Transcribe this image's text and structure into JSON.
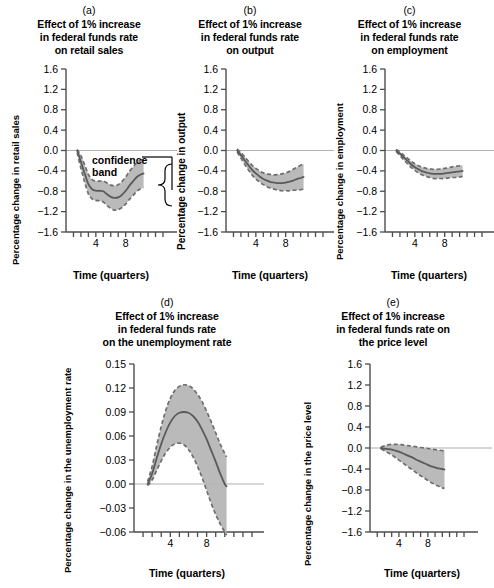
{
  "figure": {
    "background": "#ffffff",
    "band_fill": "#b4b4b4",
    "band_edge": "#6e6e6e",
    "center_line": "#5a5a5a",
    "axis_color": "#4d4d4d",
    "zero_line": "#b0b0b0",
    "x_axis_label": "Time (quarters)"
  },
  "annotation": {
    "confidence_line1": "confidence",
    "confidence_line2": "band"
  },
  "chart_data": [
    {
      "id": "panel-a",
      "type": "line",
      "letter": "(a)",
      "title_lines": [
        "Effect of 1% increase",
        "in federal funds rate",
        "on retail sales"
      ],
      "title": "Effect of 1% increase in federal funds rate on retail sales",
      "xlabel": "Time (quarters)",
      "ylabel": "Percentage change in retail sales",
      "xlim": [
        0,
        13
      ],
      "ylim": [
        -1.6,
        1.6
      ],
      "xticks": [
        1,
        2,
        3,
        4,
        5,
        6,
        7,
        8,
        9,
        10,
        11,
        12,
        13
      ],
      "xticklabels": {
        "4": "4",
        "8": "8"
      },
      "yticks": [
        1.6,
        1.2,
        0.8,
        0.4,
        0.0,
        -0.4,
        -0.8,
        -1.2,
        -1.6
      ],
      "yticklabels": [
        "1.6",
        "1.2",
        "0.8",
        "0.4",
        "0.0",
        "−0.4",
        "−0.8",
        "−1.2",
        "−1.6"
      ],
      "grid": false,
      "legend": "none",
      "zero_line": 0.0,
      "x": [
        1.5,
        2,
        2.5,
        3,
        3.5,
        4,
        4.5,
        5,
        5.5,
        6,
        6.5,
        7,
        7.5,
        8,
        8.5,
        9,
        9.5,
        10,
        10.4
      ],
      "series": [
        {
          "name": "point estimate",
          "style": "solid",
          "values": [
            0.0,
            -0.22,
            -0.45,
            -0.66,
            -0.76,
            -0.79,
            -0.79,
            -0.8,
            -0.86,
            -0.91,
            -0.93,
            -0.92,
            -0.87,
            -0.79,
            -0.69,
            -0.6,
            -0.52,
            -0.47,
            -0.45
          ]
        },
        {
          "name": "upper confidence band",
          "style": "dashed",
          "values": [
            0.02,
            -0.1,
            -0.28,
            -0.47,
            -0.57,
            -0.6,
            -0.6,
            -0.6,
            -0.64,
            -0.68,
            -0.69,
            -0.67,
            -0.61,
            -0.52,
            -0.41,
            -0.32,
            -0.24,
            -0.19,
            -0.17
          ]
        },
        {
          "name": "lower confidence band",
          "style": "dashed",
          "values": [
            -0.04,
            -0.35,
            -0.62,
            -0.85,
            -0.95,
            -0.98,
            -0.99,
            -1.01,
            -1.08,
            -1.14,
            -1.17,
            -1.16,
            -1.12,
            -1.05,
            -0.96,
            -0.88,
            -0.8,
            -0.75,
            -0.73
          ]
        }
      ]
    },
    {
      "id": "panel-b",
      "type": "line",
      "letter": "(b)",
      "title_lines": [
        "Effect of 1% increase",
        "in federal funds rate",
        "on output"
      ],
      "title": "Effect of 1% increase in federal funds rate on output",
      "xlabel": "Time (quarters)",
      "ylabel": "Percentage change in output",
      "xlim": [
        0,
        13
      ],
      "ylim": [
        -1.6,
        1.6
      ],
      "xticks": [
        1,
        2,
        3,
        4,
        5,
        6,
        7,
        8,
        9,
        10,
        11,
        12,
        13
      ],
      "xticklabels": {
        "4": "4",
        "8": "8"
      },
      "yticks": [
        1.6,
        1.2,
        0.8,
        0.4,
        0.0,
        -0.4,
        -0.8,
        -1.2,
        -1.6
      ],
      "yticklabels": [
        "1.6",
        "1.2",
        "0.8",
        "0.4",
        "0.0",
        "−0.4",
        "−0.8",
        "−1.2",
        "−1.6"
      ],
      "grid": false,
      "legend": "none",
      "zero_line": 0.0,
      "x": [
        1.5,
        2,
        2.5,
        3,
        3.5,
        4,
        4.5,
        5,
        5.5,
        6,
        6.5,
        7,
        7.5,
        8,
        8.5,
        9,
        9.5,
        10,
        10.4
      ],
      "series": [
        {
          "name": "point estimate",
          "style": "solid",
          "values": [
            0.0,
            -0.09,
            -0.19,
            -0.29,
            -0.38,
            -0.45,
            -0.51,
            -0.56,
            -0.59,
            -0.62,
            -0.63,
            -0.64,
            -0.64,
            -0.63,
            -0.61,
            -0.59,
            -0.56,
            -0.54,
            -0.52
          ]
        },
        {
          "name": "upper confidence band",
          "style": "dashed",
          "values": [
            0.03,
            -0.04,
            -0.12,
            -0.21,
            -0.29,
            -0.35,
            -0.4,
            -0.44,
            -0.46,
            -0.47,
            -0.48,
            -0.47,
            -0.46,
            -0.44,
            -0.41,
            -0.37,
            -0.33,
            -0.29,
            -0.26
          ]
        },
        {
          "name": "lower confidence band",
          "style": "dashed",
          "values": [
            -0.03,
            -0.15,
            -0.27,
            -0.38,
            -0.48,
            -0.56,
            -0.62,
            -0.67,
            -0.71,
            -0.74,
            -0.76,
            -0.78,
            -0.79,
            -0.79,
            -0.79,
            -0.78,
            -0.78,
            -0.77,
            -0.76
          ]
        }
      ]
    },
    {
      "id": "panel-c",
      "type": "line",
      "letter": "(c)",
      "title_lines": [
        "Effect of 1% increase",
        "in federal funds rate",
        "on employment"
      ],
      "title": "Effect of 1% increase in federal funds rate on employment",
      "xlabel": "Time (quarters)",
      "ylabel": "Percentage change in employment",
      "xlim": [
        0,
        13
      ],
      "ylim": [
        -1.6,
        1.6
      ],
      "xticks": [
        1,
        2,
        3,
        4,
        5,
        6,
        7,
        8,
        9,
        10,
        11,
        12,
        13
      ],
      "xticklabels": {
        "4": "4",
        "8": "8"
      },
      "yticks": [
        1.6,
        1.2,
        0.8,
        0.4,
        0.0,
        -0.4,
        -0.8,
        -1.2,
        -1.6
      ],
      "yticklabels": [
        "1.6",
        "1.2",
        "0.8",
        "0.4",
        "0.0",
        "−0.4",
        "−0.8",
        "−1.2",
        "−1.6"
      ],
      "grid": false,
      "legend": "none",
      "zero_line": 0.0,
      "x": [
        1.5,
        2,
        2.5,
        3,
        3.5,
        4,
        4.5,
        5,
        5.5,
        6,
        6.5,
        7,
        7.5,
        8,
        8.5,
        9,
        9.5,
        10,
        10.4
      ],
      "series": [
        {
          "name": "point estimate",
          "style": "solid",
          "values": [
            0.0,
            -0.06,
            -0.13,
            -0.2,
            -0.27,
            -0.33,
            -0.37,
            -0.41,
            -0.43,
            -0.45,
            -0.46,
            -0.46,
            -0.46,
            -0.45,
            -0.44,
            -0.43,
            -0.42,
            -0.41,
            -0.4
          ]
        },
        {
          "name": "upper confidence band",
          "style": "dashed",
          "values": [
            0.02,
            -0.03,
            -0.09,
            -0.15,
            -0.21,
            -0.26,
            -0.3,
            -0.33,
            -0.35,
            -0.36,
            -0.37,
            -0.37,
            -0.36,
            -0.35,
            -0.34,
            -0.32,
            -0.31,
            -0.3,
            -0.29
          ]
        },
        {
          "name": "lower confidence band",
          "style": "dashed",
          "values": [
            -0.02,
            -0.1,
            -0.18,
            -0.26,
            -0.33,
            -0.39,
            -0.44,
            -0.48,
            -0.51,
            -0.53,
            -0.55,
            -0.55,
            -0.55,
            -0.55,
            -0.54,
            -0.53,
            -0.53,
            -0.52,
            -0.51
          ]
        }
      ]
    },
    {
      "id": "panel-d",
      "type": "line",
      "letter": "(d)",
      "title_lines": [
        "Effect of 1% increase",
        "in federal funds rate",
        "on the unemployment rate"
      ],
      "title": "Effect of 1% increase in federal funds rate on the unemployment rate",
      "xlabel": "Time (quarters)",
      "ylabel": "Percentage change in the unemployment rate",
      "xlim": [
        0,
        13
      ],
      "ylim": [
        -0.06,
        0.15
      ],
      "xticks": [
        1,
        2,
        3,
        4,
        5,
        6,
        7,
        8,
        9,
        10,
        11,
        12,
        13
      ],
      "xticklabels": {
        "4": "4",
        "8": "8"
      },
      "yticks": [
        0.15,
        0.12,
        0.09,
        0.06,
        0.03,
        0.0,
        -0.03,
        -0.06
      ],
      "yticklabels": [
        "0.15",
        "0.12",
        "0.09",
        "0.06",
        "0.03",
        "0.00",
        "−0.03",
        "−0.06"
      ],
      "grid": false,
      "legend": "none",
      "zero_line": 0.0,
      "x": [
        1.5,
        2,
        2.5,
        3,
        3.5,
        4,
        4.5,
        5,
        5.5,
        6,
        6.5,
        7,
        7.5,
        8,
        8.5,
        9,
        9.5,
        10,
        10.2
      ],
      "series": [
        {
          "name": "point estimate",
          "style": "solid",
          "values": [
            0.0,
            0.013,
            0.032,
            0.05,
            0.065,
            0.077,
            0.085,
            0.089,
            0.09,
            0.089,
            0.085,
            0.078,
            0.068,
            0.056,
            0.042,
            0.028,
            0.013,
            0.0,
            -0.003
          ]
        },
        {
          "name": "upper confidence band",
          "style": "dashed",
          "values": [
            0.003,
            0.022,
            0.048,
            0.072,
            0.092,
            0.107,
            0.117,
            0.122,
            0.124,
            0.123,
            0.119,
            0.112,
            0.103,
            0.091,
            0.078,
            0.064,
            0.05,
            0.038,
            0.034
          ]
        },
        {
          "name": "lower confidence band",
          "style": "dashed",
          "values": [
            -0.002,
            0.005,
            0.017,
            0.029,
            0.039,
            0.046,
            0.05,
            0.051,
            0.049,
            0.043,
            0.034,
            0.022,
            0.008,
            -0.008,
            -0.024,
            -0.038,
            -0.05,
            -0.06,
            -0.064
          ]
        }
      ]
    },
    {
      "id": "panel-e",
      "type": "line",
      "letter": "(e)",
      "title_lines": [
        "Effect of 1% increase",
        "in federal funds rate on",
        "the price level"
      ],
      "title": "Effect of 1% increase in federal funds rate on the price level",
      "xlabel": "Time (quarters)",
      "ylabel": "Percentage change in the price level",
      "xlim": [
        0,
        13
      ],
      "ylim": [
        -1.6,
        1.6
      ],
      "xticks": [
        1,
        2,
        3,
        4,
        5,
        6,
        7,
        8,
        9,
        10,
        11,
        12,
        13
      ],
      "xticklabels": {
        "4": "4",
        "8": "8"
      },
      "yticks": [
        1.6,
        1.2,
        0.8,
        0.4,
        0.0,
        -0.4,
        -0.8,
        -1.2,
        -1.6
      ],
      "yticklabels": [
        "1.6",
        "1.2",
        "0.8",
        "0.4",
        "0.0",
        "−0.4",
        "−0.8",
        "−1.2",
        "−1.6"
      ],
      "grid": false,
      "legend": "none",
      "zero_line": 0.0,
      "x": [
        1.5,
        2,
        2.5,
        3,
        3.5,
        4,
        4.5,
        5,
        5.5,
        6,
        6.5,
        7,
        7.5,
        8,
        8.5,
        9,
        9.5,
        10,
        10.3
      ],
      "series": [
        {
          "name": "point estimate",
          "style": "solid",
          "values": [
            0.0,
            -0.01,
            -0.02,
            -0.03,
            -0.05,
            -0.07,
            -0.1,
            -0.13,
            -0.16,
            -0.19,
            -0.23,
            -0.26,
            -0.29,
            -0.32,
            -0.35,
            -0.37,
            -0.39,
            -0.4,
            -0.41
          ]
        },
        {
          "name": "upper confidence band",
          "style": "dashed",
          "values": [
            0.02,
            0.04,
            0.06,
            0.07,
            0.07,
            0.07,
            0.06,
            0.05,
            0.04,
            0.03,
            0.02,
            0.01,
            0.0,
            -0.01,
            -0.02,
            -0.03,
            -0.04,
            -0.05,
            -0.05
          ]
        },
        {
          "name": "lower confidence band",
          "style": "dashed",
          "values": [
            -0.02,
            -0.05,
            -0.09,
            -0.13,
            -0.18,
            -0.23,
            -0.28,
            -0.33,
            -0.38,
            -0.43,
            -0.48,
            -0.53,
            -0.57,
            -0.62,
            -0.66,
            -0.7,
            -0.73,
            -0.76,
            -0.77
          ]
        }
      ]
    }
  ]
}
